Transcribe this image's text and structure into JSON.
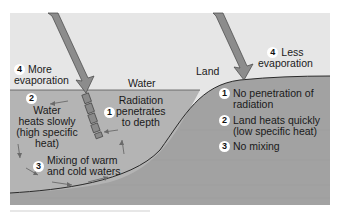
{
  "diagram": {
    "regions": {
      "water_label": "Water",
      "land_label": "Land"
    },
    "water_side": {
      "item4": {
        "number": "4",
        "text_line1": "More",
        "text_line2": "evaporation"
      },
      "item1": {
        "number": "1",
        "text_line1": "Radiation",
        "text_line2": "penetrates",
        "text_line3": "to depth"
      },
      "item2": {
        "number": "2",
        "text_line1": "Water",
        "text_line2": "heats slowly",
        "text_line3": "(high specific",
        "text_line4": "heat)"
      },
      "item3": {
        "number": "3",
        "text_line1": "Mixing of warm",
        "text_line2": "and cold waters"
      }
    },
    "land_side": {
      "item4": {
        "number": "4",
        "text_line1": "Less",
        "text_line2": "evaporation"
      },
      "item1": {
        "number": "1",
        "text_line1": "No penetration of",
        "text_line2": "radiation"
      },
      "item2": {
        "number": "2",
        "text_line1": "Land heats quickly",
        "text_line2": "(low specific heat)"
      },
      "item3": {
        "number": "3",
        "text_line1": "No mixing"
      }
    },
    "colors": {
      "sky": "#e6e6e6",
      "water": "#b4b4b4",
      "land": "#a2a2a2",
      "arrow": "#8c8c8c",
      "boundary": "#2a2a2a"
    }
  }
}
